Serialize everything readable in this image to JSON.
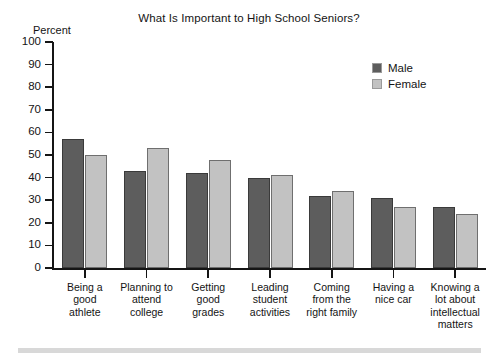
{
  "chart_data": {
    "type": "bar",
    "title": "What Is Important to High School Seniors?",
    "xlabel": "",
    "ylabel": "Percent",
    "ylim": [
      0,
      100
    ],
    "ytick_step": 10,
    "yticks": [
      "100",
      "90",
      "80",
      "70",
      "60",
      "50",
      "40",
      "30",
      "20",
      "10",
      "0"
    ],
    "grid": false,
    "legend_position": "top-right",
    "categories": [
      "Being a good athlete",
      "Planning to attend college",
      "Getting good grades",
      "Leading student activities",
      "Coming from the right family",
      "Having a nice car",
      "Knowing a lot about intellectual matters"
    ],
    "category_lines": [
      [
        "Being a",
        "good",
        "athlete"
      ],
      [
        "Planning to",
        "attend",
        "college"
      ],
      [
        "Getting",
        "good",
        "grades"
      ],
      [
        "Leading",
        "student",
        "activities"
      ],
      [
        "Coming",
        "from the",
        "right family"
      ],
      [
        "Having a",
        "nice car"
      ],
      [
        "Knowing a",
        "lot about",
        "intellectual",
        "matters"
      ]
    ],
    "series": [
      {
        "name": "Male",
        "color": "#5d5d5d",
        "values": [
          57,
          43,
          42,
          40,
          32,
          31,
          27
        ]
      },
      {
        "name": "Female",
        "color": "#c2c2c2",
        "values": [
          50,
          53,
          48,
          41,
          34,
          27,
          24
        ]
      }
    ]
  },
  "legend": {
    "items": [
      {
        "label": "Male",
        "swatch": "male"
      },
      {
        "label": "Female",
        "swatch": "female"
      }
    ]
  },
  "colors": {
    "male": "#5d5d5d",
    "female": "#c2c2c2",
    "axis": "#151515",
    "text": "#141414",
    "bottom_rule": "#d8d8d8"
  }
}
